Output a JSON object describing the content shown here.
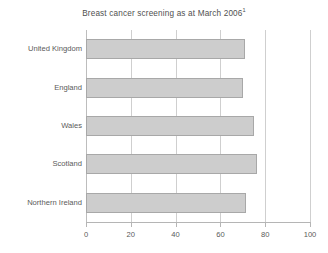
{
  "chart_data": {
    "type": "bar",
    "orientation": "horizontal",
    "title": "Breast cancer screening as at March 2006",
    "title_superscript": "1",
    "xlabel": "",
    "ylabel": "",
    "categories": [
      "United Kingdom",
      "England",
      "Wales",
      "Scotland",
      "Northern Ireland"
    ],
    "values": [
      71,
      70,
      75,
      76.5,
      71.5
    ],
    "xlim": [
      0,
      100
    ],
    "xticks": [
      0,
      20,
      40,
      60,
      80,
      100
    ],
    "xtick_labels": [
      "0",
      "20",
      "40",
      "60",
      "80",
      "100"
    ],
    "grid": "vertical",
    "legend": "none",
    "series": [
      {
        "name": "Breast cancer screening coverage",
        "values": [
          71,
          70,
          75,
          76.5,
          71.5
        ]
      }
    ]
  },
  "style": {
    "bar_fill": "#cdcdcd",
    "bar_border": "#a8a8a8",
    "gridline_color": "#cfcfcf",
    "axis_color": "#b5b5b5",
    "text_color": "#5a5a5a",
    "background": "#ffffff"
  }
}
